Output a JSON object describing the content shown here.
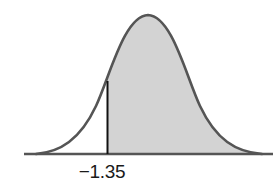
{
  "diagram": {
    "type": "normal-distribution-curve",
    "shaded_region": "right of z",
    "z_value_label": "−1.35",
    "z_value": -1.35,
    "colors": {
      "curve_stroke": "#555555",
      "shaded_fill": "#d3d3d3",
      "axis": "#555555",
      "boundary_line": "#111111",
      "label_text": "#1a1a1a"
    }
  }
}
